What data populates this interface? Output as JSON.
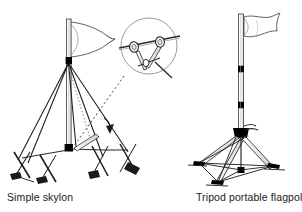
{
  "figure": {
    "type": "technical-line-illustration",
    "background_color": "#ffffff",
    "line_color": "#000000",
    "shade_color": "#7a7a7a",
    "text_color": "#1a1a1a"
  },
  "captions": {
    "left": "Simple skylon",
    "right": "Tripod portable flagpole"
  },
  "panels": [
    {
      "id": "left-panel",
      "name": "simple-skylon",
      "caption": "Simple skylon",
      "parts": [
        "vertical pole",
        "pennant flag",
        "black collar band",
        "guy lines",
        "crossed ground stakes",
        "detail callout circle",
        "dotted leader line",
        "direction arrow"
      ]
    },
    {
      "id": "right-panel",
      "name": "tripod-portable-flagpole",
      "caption": "Tripod portable flagpole",
      "parts": [
        "telescoping pole",
        "wavy banner flag",
        "black collar clamps",
        "tripod head",
        "three splayed legs",
        "cross-bracing struts",
        "ground line"
      ]
    }
  ],
  "detail_callout": {
    "name": "clamp-detail-circle",
    "shows": "guy line clamp fitting on horizontal bar"
  }
}
